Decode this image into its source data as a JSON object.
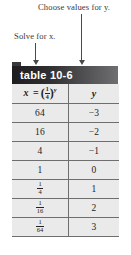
{
  "annotations": {
    "choose_values": "Choose values for y.",
    "solve_for_x": "Solve for x."
  },
  "table": {
    "caption": "table 10-6",
    "columns": [
      {
        "key": "x",
        "header": "x = (1/4)^y"
      },
      {
        "key": "y",
        "header": "y"
      }
    ],
    "rows": [
      {
        "x": "64",
        "y": "−3"
      },
      {
        "x": "16",
        "y": "−2"
      },
      {
        "x": "4",
        "y": "−1"
      },
      {
        "x": "1",
        "y": "0"
      },
      {
        "x": "1/4",
        "y": "1"
      },
      {
        "x": "1/16",
        "y": "2"
      },
      {
        "x": "1/64",
        "y": "3"
      }
    ]
  },
  "colors": {
    "caption_dark": "#1d1c1e",
    "caption_light": "#6f6e70",
    "table_bg": "#eaeaea",
    "rule": "#6e6e6e",
    "arrow": "#4a4a4a",
    "page_bg": "#ffffff"
  }
}
